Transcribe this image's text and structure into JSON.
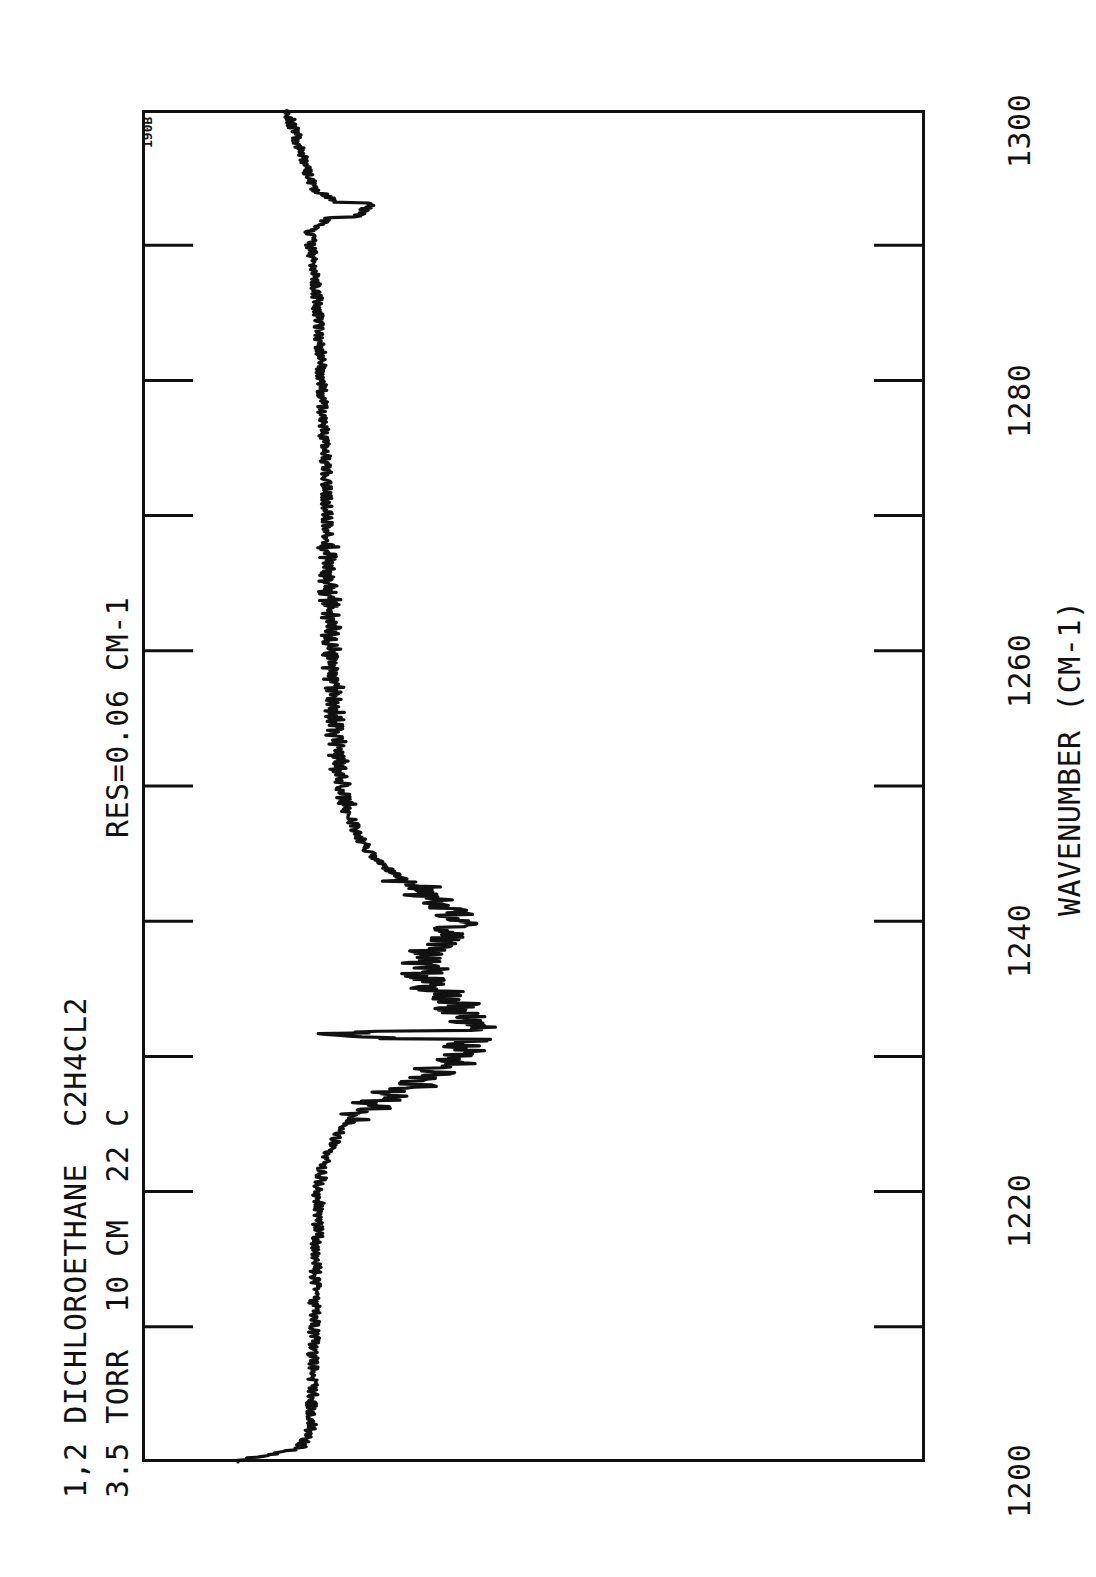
{
  "figure": {
    "sample_id": "190B",
    "header_line_1": "1,2 DICHLOROETHANE  C2H4CL2",
    "header_line_2": "3.5 TORR  10 CM  22 C",
    "resolution_label": "RES=0.06 CM-1",
    "background_color": "#ffffff",
    "trace_color": "#111111",
    "axis_color": "#111111"
  },
  "chart_data": {
    "type": "line",
    "title": "1,2 DICHLOROETHANE  C2H4CL2",
    "subtitle": "3.5 TORR  10 CM  22 C",
    "annotations": [
      "RES=0.06 CM-1",
      "190B"
    ],
    "xlabel": "WAVENUMBER (CM-1)",
    "ylabel": "",
    "xlim": [
      1200,
      1300
    ],
    "ylim": [
      0,
      1
    ],
    "grid": false,
    "legend": null,
    "orientation": "rotated-90-ccw",
    "xticks": [
      1200,
      1210,
      1220,
      1230,
      1240,
      1250,
      1260,
      1270,
      1280,
      1290,
      1300
    ],
    "xticklabels": [
      "1200",
      "",
      "1220",
      "",
      "1240",
      "",
      "1260",
      "",
      "1280",
      "",
      "1300"
    ],
    "labeled_xticks": [
      "1200",
      "1220",
      "1240",
      "1260",
      "1280",
      "1300"
    ],
    "x": [
      1200,
      1201,
      1202,
      1203,
      1204,
      1205,
      1206,
      1207,
      1208,
      1209,
      1210,
      1211,
      1212,
      1213,
      1214,
      1215,
      1216,
      1217,
      1218,
      1219,
      1220,
      1221,
      1222,
      1223,
      1224,
      1225,
      1226,
      1227,
      1228,
      1229,
      1230,
      1231,
      1232,
      1233,
      1234,
      1235,
      1236,
      1237,
      1238,
      1239,
      1240,
      1241,
      1242,
      1243,
      1244,
      1245,
      1246,
      1247,
      1248,
      1249,
      1250,
      1251,
      1252,
      1253,
      1254,
      1255,
      1256,
      1257,
      1258,
      1259,
      1260,
      1261,
      1262,
      1263,
      1264,
      1265,
      1266,
      1267,
      1268,
      1269,
      1270,
      1271,
      1272,
      1273,
      1274,
      1275,
      1276,
      1277,
      1278,
      1279,
      1280,
      1281,
      1282,
      1283,
      1284,
      1285,
      1286,
      1287,
      1288,
      1289,
      1290,
      1291,
      1292,
      1293,
      1294,
      1295,
      1296,
      1297,
      1298,
      1299,
      1300
    ],
    "y": [
      0.0,
      0.102,
      0.118,
      0.122,
      0.12,
      0.124,
      0.121,
      0.125,
      0.122,
      0.126,
      0.124,
      0.127,
      0.125,
      0.129,
      0.127,
      0.13,
      0.128,
      0.132,
      0.13,
      0.133,
      0.131,
      0.136,
      0.14,
      0.148,
      0.16,
      0.178,
      0.205,
      0.24,
      0.282,
      0.322,
      0.352,
      0.368,
      0.372,
      0.362,
      0.34,
      0.318,
      0.3,
      0.296,
      0.312,
      0.34,
      0.352,
      0.338,
      0.305,
      0.268,
      0.236,
      0.214,
      0.198,
      0.188,
      0.18,
      0.174,
      0.17,
      0.167,
      0.164,
      0.162,
      0.16,
      0.158,
      0.157,
      0.156,
      0.155,
      0.154,
      0.153,
      0.152,
      0.151,
      0.15,
      0.15,
      0.149,
      0.148,
      0.148,
      0.147,
      0.146,
      0.146,
      0.145,
      0.144,
      0.144,
      0.143,
      0.142,
      0.141,
      0.14,
      0.139,
      0.138,
      0.137,
      0.136,
      0.135,
      0.134,
      0.133,
      0.131,
      0.13,
      0.128,
      0.126,
      0.124,
      0.12,
      0.118,
      0.15,
      0.17,
      0.13,
      0.118,
      0.112,
      0.105,
      0.098,
      0.09,
      0.082
    ]
  },
  "axis": {
    "x_axis_title": "WAVENUMBER (CM-1)",
    "tick_1300": "1300",
    "tick_1280": "1280",
    "tick_1260": "1260",
    "tick_1240": "1240",
    "tick_1220": "1220",
    "tick_1200": "1200"
  }
}
